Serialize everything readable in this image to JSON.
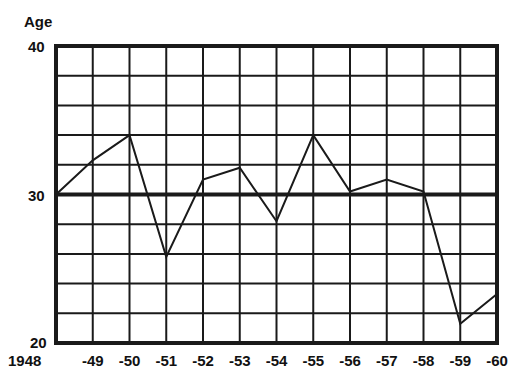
{
  "chart_data": {
    "type": "line",
    "title": "",
    "xlabel": "",
    "ylabel": "Age",
    "ylim": [
      20,
      40
    ],
    "grid": true,
    "categories": [
      "1948",
      "-49",
      "-50",
      "-51",
      "-52",
      "-53",
      "-54",
      "-55",
      "-56",
      "-57",
      "-58",
      "-59",
      "-60"
    ],
    "y_tick_labels": [
      "40",
      "30",
      "20"
    ],
    "series": [
      {
        "name": "Age",
        "values": [
          30,
          32.3,
          34,
          25.8,
          31,
          31.8,
          28.2,
          34,
          30.2,
          31,
          30.2,
          21.3,
          23.3
        ]
      }
    ],
    "reference_line": 30
  },
  "colors": {
    "line": "#1a1a1a",
    "grid": "#1a1a1a",
    "background": "#ffffff"
  }
}
